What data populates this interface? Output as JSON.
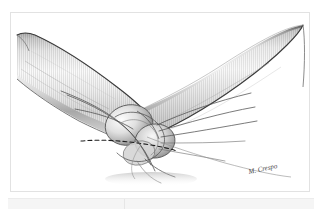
{
  "figure": {
    "medium": "pen-and-ink medical illustration",
    "palette": {
      "background": "#ffffff",
      "frame_border": "#e2e2e2",
      "ink_dark": "#2f2f2f",
      "ink_mid": "#7a7a7a",
      "ink_light": "#bdbdbd",
      "skin_light": "#fbfbfb",
      "skin_shadow": "#9a9a9a",
      "skin_deep_shadow": "#6b6b6b",
      "suture_line": "#555555",
      "dashed_line": "#1f1f1f",
      "footer_band": "#f5f5f5",
      "footer_rule": "#ececec"
    },
    "signature": "M. Crespo",
    "labels": {
      "upper_arm": "Humerus / upper arm",
      "forearm": "Forearm",
      "olecranon": "Olecranon",
      "suture_fan": "Suture strands",
      "dashed_incision": "Dashed guide line"
    },
    "annotations": {
      "hatching": "vertical line shading",
      "view": "posterior",
      "flexion": "acutely flexed"
    }
  },
  "page": {
    "footer_visible": true
  }
}
